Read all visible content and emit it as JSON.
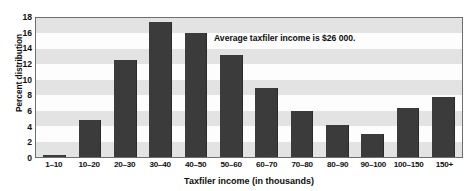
{
  "chart_data": {
    "type": "bar",
    "title": "",
    "xlabel": "Taxfiler income (in thousands)",
    "ylabel": "Percent distribution",
    "categories": [
      "1–10",
      "10–20",
      "20–30",
      "30–40",
      "40–50",
      "50–60",
      "60–70",
      "70–80",
      "80–90",
      "90–100",
      "100–150",
      "150+"
    ],
    "values": [
      0.3,
      4.8,
      12.5,
      17.5,
      16.0,
      13.2,
      8.9,
      5.9,
      4.2,
      3.0,
      6.3,
      7.8
    ],
    "ylim": [
      0,
      18
    ],
    "yticks": [
      0,
      2,
      4,
      6,
      8,
      10,
      12,
      14,
      16,
      18
    ],
    "ytick_labels": [
      "0",
      "2",
      "4",
      "6",
      "8",
      "10",
      "12",
      "14",
      "16",
      "18"
    ],
    "grid": "horizontal-bands",
    "legend": "none",
    "annotations": [
      {
        "text": "Average taxfiler income is $26 000."
      }
    ],
    "bar_color": "#3b3b3b",
    "band_color": "#e3e3e3",
    "plot_background": "#fdfdfd",
    "frame_color": "#6e6e6e"
  }
}
